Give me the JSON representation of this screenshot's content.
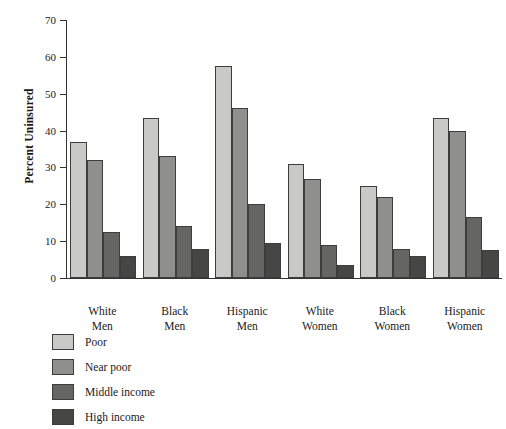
{
  "chart_data": {
    "type": "bar",
    "title": "",
    "subtitle": "",
    "xlabel": "",
    "ylabel": "Percent Uninsured",
    "ylim": [
      0,
      70
    ],
    "ytick_step": 10,
    "yticks": [
      "0",
      "10",
      "20",
      "30",
      "40",
      "50",
      "60",
      "70"
    ],
    "grid": false,
    "legend_position": "bottom-left",
    "categories": [
      "White\nMen",
      "Black\nMen",
      "Hispanic\nMen",
      "White\nWomen",
      "Black\nWomen",
      "Hispanic\nWomen"
    ],
    "category_lines": [
      [
        "White",
        "Men"
      ],
      [
        "Black",
        "Men"
      ],
      [
        "Hispanic",
        "Men"
      ],
      [
        "White",
        "Women"
      ],
      [
        "Black",
        "Women"
      ],
      [
        "Hispanic",
        "Women"
      ]
    ],
    "series": [
      {
        "name": "Poor",
        "color": "#c9c9c5",
        "values": [
          37,
          43.5,
          57.5,
          31,
          25,
          43.5
        ]
      },
      {
        "name": "Near poor",
        "color": "#8f8f8c",
        "values": [
          32,
          33,
          46,
          27,
          22,
          40
        ]
      },
      {
        "name": "Middle income",
        "color": "#656562",
        "values": [
          12.5,
          14,
          20,
          9,
          8,
          16.5
        ]
      },
      {
        "name": "High income",
        "color": "#464644",
        "values": [
          6,
          8,
          9.5,
          3.5,
          6,
          7.5
        ]
      }
    ]
  }
}
